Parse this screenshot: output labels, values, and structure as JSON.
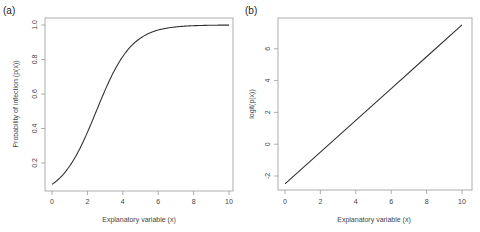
{
  "chart_data": [
    {
      "panel": "(a)",
      "type": "line",
      "title": "",
      "xlabel": "Explanatory variable (x)",
      "ylabel": "Probability of infection (p(x))",
      "xlim": [
        0,
        10
      ],
      "ylim": [
        0.076,
        1.0
      ],
      "xticks": [
        0,
        2,
        4,
        6,
        8,
        10
      ],
      "yticks": [
        0.2,
        0.4,
        0.6,
        0.8,
        1.0
      ],
      "grid": false,
      "legend": null,
      "series": [
        {
          "name": "p(x) = 1/(1+exp(-(x-2.5)))",
          "x": [
            0,
            0.5,
            1,
            1.5,
            2,
            2.5,
            3,
            3.5,
            4,
            4.5,
            5,
            5.5,
            6,
            6.5,
            7,
            7.5,
            8,
            8.5,
            9,
            9.5,
            10
          ],
          "y": [
            0.076,
            0.119,
            0.182,
            0.269,
            0.378,
            0.5,
            0.622,
            0.731,
            0.818,
            0.881,
            0.924,
            0.953,
            0.971,
            0.982,
            0.989,
            0.993,
            0.996,
            0.998,
            0.998,
            0.999,
            0.999
          ]
        }
      ]
    },
    {
      "panel": "(b)",
      "type": "line",
      "title": "",
      "xlabel": "Explanatory variable (x)",
      "ylabel": "logit(p(x))",
      "xlim": [
        0,
        10
      ],
      "ylim": [
        -2.5,
        7.5
      ],
      "xticks": [
        0,
        2,
        4,
        6,
        8,
        10
      ],
      "yticks": [
        -2,
        0,
        2,
        4,
        6
      ],
      "grid": false,
      "legend": null,
      "series": [
        {
          "name": "logit(p(x)) = -2.5 + x",
          "x": [
            0,
            2,
            4,
            6,
            8,
            10
          ],
          "y": [
            -2.5,
            -0.5,
            1.5,
            3.5,
            5.5,
            7.5
          ]
        }
      ]
    }
  ],
  "panels": {
    "a": {
      "label": "(a)",
      "xlabel": "Explanatory variable (x)",
      "ylabel": "Probability of infection (p(x))",
      "xticks": [
        "0",
        "2",
        "4",
        "6",
        "8",
        "10"
      ],
      "yticks": [
        "0.2",
        "0.4",
        "0.6",
        "0.8",
        "1.0"
      ]
    },
    "b": {
      "label": "(b)",
      "xlabel": "Explanatory variable (x)",
      "ylabel": "logit(p(x))",
      "xticks": [
        "0",
        "2",
        "4",
        "6",
        "8",
        "10"
      ],
      "yticks": [
        "-2",
        "0",
        "2",
        "4",
        "6"
      ]
    }
  },
  "colors": {
    "line": "#333333",
    "axis": "#888888",
    "text": "#444444"
  }
}
